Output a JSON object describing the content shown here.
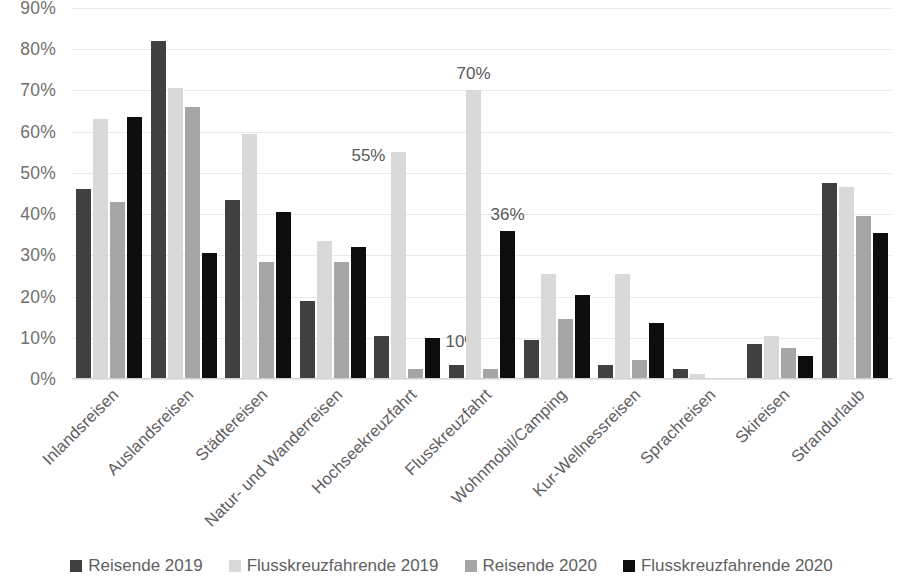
{
  "chart_data": {
    "type": "bar",
    "title": "",
    "subtitle": "",
    "xlabel": "",
    "ylabel": "",
    "ylim": [
      0,
      90
    ],
    "ytick_labels": [
      "0%",
      "10%",
      "20%",
      "30%",
      "40%",
      "50%",
      "60%",
      "70%",
      "80%",
      "90%"
    ],
    "ytick_values": [
      0,
      10,
      20,
      30,
      40,
      50,
      60,
      70,
      80,
      90
    ],
    "grid": true,
    "legend_position": "bottom",
    "categories": [
      "Inlandsreisen",
      "Auslandsreisen",
      "Städtereisen",
      "Natur- und Wanderreisen",
      "Hochseekreuzfahrt",
      "Flusskreuzfahrt",
      "Wohnmobil/Camping",
      "Kur-Wellnessreisen",
      "Sprachreisen",
      "Skireisen",
      "Strandurlaub"
    ],
    "series": [
      {
        "name": "Reisende 2019",
        "color": "#404040",
        "values": [
          46,
          82,
          43.5,
          19,
          10.5,
          3.5,
          9.5,
          3.5,
          2.5,
          8.5,
          47.5
        ]
      },
      {
        "name": "Flusskreuzfahrende 2019",
        "color": "#d9d9d9",
        "values": [
          63,
          70.5,
          59.5,
          33.5,
          55,
          70,
          25.5,
          25.5,
          1.2,
          10.5,
          46.5
        ]
      },
      {
        "name": "Reisende 2020",
        "color": "#a6a6a6",
        "values": [
          43,
          66,
          28.5,
          28.5,
          2.5,
          2.5,
          14.5,
          4.5,
          0,
          7.5,
          39.5
        ]
      },
      {
        "name": "Flusskreuzfahrende 2020",
        "color": "#0d0d0d",
        "values": [
          63.5,
          30.5,
          40.5,
          32,
          10,
          36,
          20.5,
          13.5,
          0,
          5.5,
          35.5
        ]
      }
    ],
    "data_labels": [
      {
        "category": "Hochseekreuzfahrt",
        "series": "Flusskreuzfahrende 2019",
        "text": "55%",
        "position": "left"
      },
      {
        "category": "Hochseekreuzfahrt",
        "series": "Flusskreuzfahrende 2020",
        "text": "10%",
        "position": "right"
      },
      {
        "category": "Flusskreuzfahrt",
        "series": "Flusskreuzfahrende 2019",
        "text": "70%",
        "position": "top"
      },
      {
        "category": "Flusskreuzfahrt",
        "series": "Flusskreuzfahrende 2020",
        "text": "36%",
        "position": "top"
      }
    ]
  },
  "legend": {
    "items": [
      {
        "label": "Reisende 2019",
        "color": "#404040"
      },
      {
        "label": "Flusskreuzfahrende 2019",
        "color": "#d9d9d9"
      },
      {
        "label": "Reisende 2020",
        "color": "#a6a6a6"
      },
      {
        "label": "Flusskreuzfahrende 2020",
        "color": "#0d0d0d"
      }
    ]
  },
  "colors": {
    "gridline": "#e8e8ea",
    "tick_text": "#6f6f6f",
    "label_text": "#5e5e5e",
    "background": "#ffffff"
  }
}
